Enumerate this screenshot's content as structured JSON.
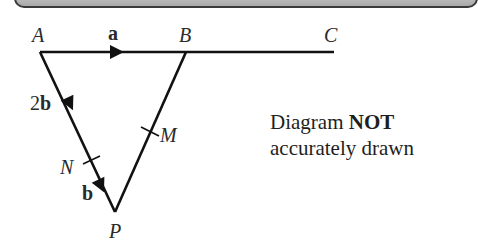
{
  "diagram": {
    "points": {
      "A": {
        "label": "A",
        "x": 40,
        "y": 52
      },
      "B": {
        "label": "B",
        "x": 186,
        "y": 52
      },
      "C": {
        "label": "C",
        "x": 334,
        "y": 52
      },
      "P": {
        "label": "P",
        "x": 115,
        "y": 212
      },
      "N": {
        "label": "N"
      },
      "M": {
        "label": "M"
      }
    },
    "vectors": {
      "AB": "a",
      "AN_coef": "2",
      "AN_vec": "b",
      "NP": "b"
    },
    "note": {
      "line1_prefix": "Diagram ",
      "line1_bold": "NOT",
      "line2": "accurately drawn"
    },
    "colors": {
      "line": "#111111",
      "text": "#2a2a2a"
    }
  }
}
